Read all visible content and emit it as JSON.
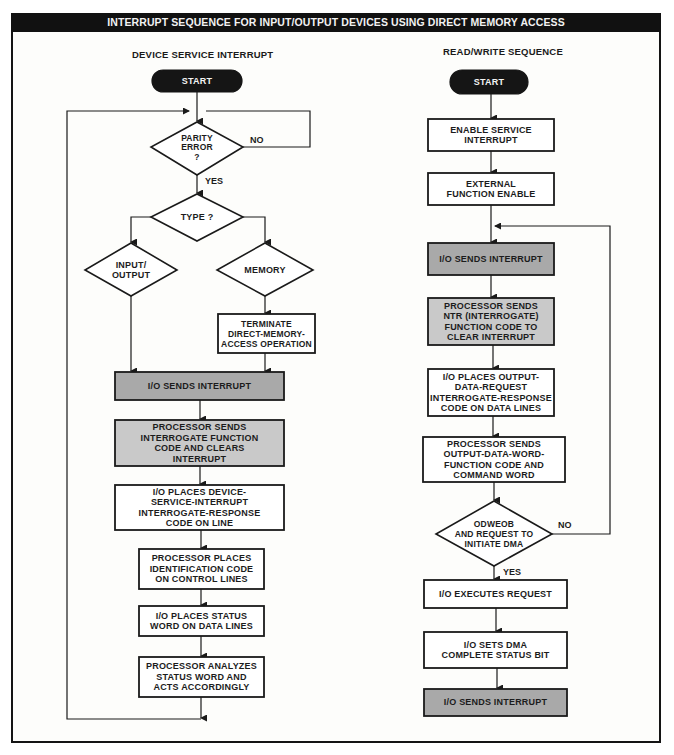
{
  "title": "INTERRUPT SEQUENCE FOR INPUT/OUTPUT DEVICES USING DIRECT MEMORY ACCESS",
  "colors": {
    "frame": "#141414",
    "title_bg": "#111111",
    "dark_gray_fill": "#a9a9a9",
    "light_gray_fill": "#c9c9c9",
    "white_fill": "#ffffff"
  },
  "left": {
    "heading": "DEVICE SERVICE INTERRUPT",
    "nodes": {
      "start": "START",
      "parity": "PARITY\nERROR\n?",
      "type": "TYPE ?",
      "io": "INPUT/\nOUTPUT",
      "memory": "MEMORY",
      "terminate": "TERMINATE\nDIRECT-MEMORY-\nACCESS OPERATION",
      "io_sends": "I/O SENDS INTERRUPT",
      "proc_sends": "PROCESSOR SENDS\nINTERROGATE FUNCTION\nCODE AND CLEARS\nINTERRUPT",
      "io_places": "I/O PLACES DEVICE-\nSERVICE-INTERRUPT\nINTERROGATE-RESPONSE\nCODE ON LINE",
      "proc_places": "PROCESSOR PLACES\nIDENTIFICATION CODE\nON CONTROL LINES",
      "io_status": "I/O PLACES STATUS\nWORD ON DATA LINES",
      "proc_analyzes": "PROCESSOR ANALYZES\nSTATUS WORD AND\nACTS ACCORDINGLY"
    },
    "labels": {
      "no": "NO",
      "yes": "YES"
    }
  },
  "right": {
    "heading": "READ/WRITE SEQUENCE",
    "nodes": {
      "start": "START",
      "enable": "ENABLE SERVICE\nINTERRUPT",
      "external": "EXTERNAL\nFUNCTION ENABLE",
      "io_sends": "I/O SENDS INTERRUPT",
      "proc_ntr": "PROCESSOR SENDS\nNTR (INTERROGATE)\nFUNCTION CODE TO\nCLEAR INTERRUPT",
      "io_output": "I/O PLACES OUTPUT-\nDATA-REQUEST\nINTERROGATE-RESPONSE\nCODE ON DATA LINES",
      "proc_odw": "PROCESSOR SENDS\nOUTPUT-DATA-WORD-\nFUNCTION CODE AND\nCOMMAND WORD",
      "odweob": "ODWEOB\nAND REQUEST TO\nINITIATE DMA",
      "executes": "I/O EXECUTES REQUEST",
      "sets_dma": "I/O SETS DMA\nCOMPLETE STATUS BIT",
      "io_sends_end": "I/O SENDS INTERRUPT"
    },
    "labels": {
      "no": "NO",
      "yes": "YES"
    }
  }
}
